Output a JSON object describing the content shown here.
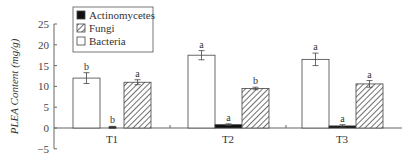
{
  "chart_data": {
    "type": "bar",
    "title": "",
    "xlabel": "",
    "ylabel": "PLEA Content (mg/g)",
    "ylim": [
      -5,
      25
    ],
    "yticks": [
      -5,
      0,
      5,
      10,
      15,
      20,
      25
    ],
    "grid": false,
    "legend_position": "upper-left",
    "categories": [
      "T1",
      "T2",
      "T3"
    ],
    "series": [
      {
        "name": "Bacteria",
        "fill": "white",
        "values": [
          12.0,
          17.5,
          16.5
        ],
        "errors": [
          1.3,
          1.1,
          1.5
        ],
        "significance": [
          "b",
          "a",
          "a"
        ]
      },
      {
        "name": "Actinomycetes",
        "fill": "black",
        "values": [
          0.3,
          0.8,
          0.5
        ],
        "errors": [
          0.1,
          0.2,
          0.3
        ],
        "significance": [
          "b",
          "a",
          "a"
        ]
      },
      {
        "name": "Fungi",
        "fill": "hatched",
        "values": [
          11.0,
          9.5,
          10.6
        ],
        "errors": [
          0.6,
          0.3,
          0.8
        ],
        "significance": [
          "a",
          "b",
          "a"
        ]
      }
    ],
    "legend": [
      "Actinomycetes",
      "Fungi",
      "Bacteria"
    ]
  }
}
